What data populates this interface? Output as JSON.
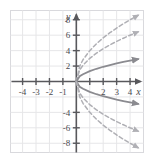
{
  "figure": {
    "title": "",
    "axis_labels": {
      "x": "x",
      "y": "y"
    }
  },
  "colors": {
    "background": "#ffffff",
    "grid": "#e6e6e8",
    "plot_border": "#d9d9dd",
    "axis": "#58585c",
    "tick_label": "#4a4a4e",
    "curve_solid": "#8b8b90",
    "curve_dashed": "#b0b0b5"
  },
  "chart_data": {
    "type": "line",
    "title": "",
    "xlabel": "x",
    "ylabel": "y",
    "xlim": [
      -4.9,
      5.0
    ],
    "ylim": [
      -9.2,
      9.2
    ],
    "grid": true,
    "legend": null,
    "xticks": [
      -4,
      -3,
      -2,
      -1,
      1,
      2,
      3,
      4
    ],
    "xtick_labels": [
      "-4",
      "-3",
      "-2",
      "-1",
      "",
      "2",
      "3",
      "4"
    ],
    "yticks": [
      -8,
      -6,
      -4,
      2,
      4,
      6,
      8
    ],
    "ytick_labels": [
      "-8",
      "-6",
      "-4",
      "2",
      "4",
      "6",
      "8"
    ],
    "series": [
      {
        "name": "upper-outer",
        "style": "dashed",
        "equation": "y = 4*sqrt(x)",
        "coefficient": 4,
        "branch": "upper",
        "arrow": "right",
        "x": [
          0,
          0.25,
          0.5,
          1,
          1.5,
          2,
          2.5,
          3,
          3.5,
          4,
          4.6
        ],
        "y": [
          0,
          2.0,
          2.83,
          4.0,
          4.9,
          5.66,
          6.32,
          6.93,
          7.48,
          8.0,
          8.58
        ]
      },
      {
        "name": "upper-middle",
        "style": "dashed",
        "equation": "y = 3*sqrt(x)",
        "coefficient": 3,
        "branch": "upper",
        "arrow": "right",
        "x": [
          0,
          0.25,
          0.5,
          1,
          1.5,
          2,
          2.5,
          3,
          3.5,
          4,
          4.6
        ],
        "y": [
          0,
          1.5,
          2.12,
          3.0,
          3.67,
          4.24,
          4.74,
          5.2,
          5.61,
          6.0,
          6.43
        ]
      },
      {
        "name": "upper-inner",
        "style": "solid",
        "equation": "y = sqrt(x)",
        "coefficient": 1.35,
        "branch": "upper",
        "arrow": "right",
        "x": [
          0,
          0.25,
          0.5,
          1,
          1.5,
          2,
          2.5,
          3,
          3.5,
          4,
          4.6
        ],
        "y": [
          0,
          0.68,
          0.95,
          1.35,
          1.65,
          1.91,
          2.13,
          2.34,
          2.53,
          2.7,
          2.9
        ]
      },
      {
        "name": "lower-inner",
        "style": "solid",
        "equation": "y = -sqrt(x)",
        "coefficient": -1.35,
        "branch": "lower",
        "arrow": "right",
        "x": [
          0,
          0.25,
          0.5,
          1,
          1.5,
          2,
          2.5,
          3,
          3.5,
          4,
          4.6
        ],
        "y": [
          0,
          -0.68,
          -0.95,
          -1.35,
          -1.65,
          -1.91,
          -2.13,
          -2.34,
          -2.53,
          -2.7,
          -2.9
        ]
      },
      {
        "name": "lower-middle",
        "style": "dashed",
        "equation": "y = -3*sqrt(x)",
        "coefficient": -3,
        "branch": "lower",
        "arrow": "right",
        "x": [
          0,
          0.25,
          0.5,
          1,
          1.5,
          2,
          2.5,
          3,
          3.5,
          4,
          4.6
        ],
        "y": [
          0,
          -1.5,
          -2.12,
          -3.0,
          -3.67,
          -4.24,
          -4.74,
          -5.2,
          -5.61,
          -6.0,
          -6.43
        ]
      },
      {
        "name": "lower-outer",
        "style": "dashed",
        "equation": "y = -4*sqrt(x)",
        "coefficient": -4,
        "branch": "lower",
        "arrow": "right",
        "x": [
          0,
          0.25,
          0.5,
          1,
          1.5,
          2,
          2.5,
          3,
          3.5,
          4,
          4.6
        ],
        "y": [
          0,
          -2.0,
          -2.83,
          -4.0,
          -4.9,
          -5.66,
          -6.32,
          -6.93,
          -7.48,
          -8.0,
          -8.58
        ]
      }
    ]
  }
}
